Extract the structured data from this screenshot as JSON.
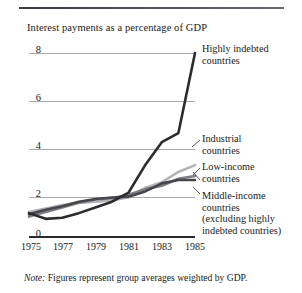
{
  "chart_data": {
    "type": "line",
    "title": "Interest payments as a percentage of GDP",
    "xlabel": "",
    "ylabel": "",
    "ylim": [
      0,
      8
    ],
    "xlim": [
      1975,
      1985
    ],
    "yticks": [
      "0",
      "2",
      "4",
      "6",
      "8"
    ],
    "grid": true,
    "legend_position": "right-inline-labels",
    "x": [
      1975,
      1976,
      1977,
      1978,
      1979,
      1980,
      1981,
      1982,
      1983,
      1984,
      1985
    ],
    "series": [
      {
        "name": "Highly indebted countries",
        "color": "#2b2b30",
        "values": [
          1.0,
          0.75,
          0.8,
          1.0,
          1.25,
          1.5,
          1.9,
          3.1,
          4.1,
          4.5,
          8.0
        ]
      },
      {
        "name": "Industrial countries",
        "color": "#b4b4b8",
        "values": [
          1.05,
          1.2,
          1.35,
          1.45,
          1.5,
          1.55,
          1.7,
          2.1,
          2.35,
          2.8,
          3.1
        ]
      },
      {
        "name": "Low-income countries",
        "color": "#7d7d84",
        "values": [
          0.85,
          1.05,
          1.25,
          1.45,
          1.6,
          1.65,
          1.8,
          2.05,
          2.2,
          2.5,
          2.62
        ]
      },
      {
        "name": "Middle-income countries (excluding highly indebted countries)",
        "color": "#46464c",
        "values": [
          0.95,
          1.15,
          1.3,
          1.5,
          1.62,
          1.68,
          1.72,
          1.95,
          2.3,
          2.45,
          2.45
        ]
      }
    ],
    "xticks": [
      "1975",
      "1977",
      "1979",
      "1981",
      "1983",
      "1985"
    ]
  },
  "legend": {
    "highly_indebted": {
      "line1": "Highly indebted",
      "line2": "countries"
    },
    "industrial": {
      "line1": "Industrial",
      "line2": "countries"
    },
    "low_income": {
      "line1": "Low-income",
      "line2": "countries"
    },
    "middle_income": {
      "line1": "Middle-income",
      "line2": "countries",
      "line3": "(excluding highly",
      "line4": "indebted countries)"
    }
  },
  "note": {
    "label": "Note:",
    "text": " Figures represent group averages weighted by GDP."
  }
}
